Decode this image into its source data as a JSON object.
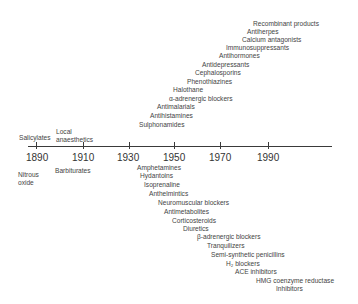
{
  "timeline": {
    "years": [
      "1890",
      "1910",
      "1930",
      "1950",
      "1970",
      "1990"
    ],
    "above": {
      "salicylates": "Salicylates",
      "local_anaesthetics_1": "Local",
      "local_anaesthetics_2": "anaesthetics",
      "items": [
        "Recombinant products",
        "Antiherpes",
        "Calcium antagonists",
        "Immunosuppressants",
        "Antihormones",
        "Antidepressants",
        "Cephalosporins",
        "Phenothiazines",
        "Halothane",
        "α-adrenergic blockers",
        "Antimalarials",
        "Antihistamines",
        "Sulphonamides"
      ]
    },
    "below": {
      "nitrous_oxide_1": "Nitrous",
      "nitrous_oxide_2": "oxide",
      "barbiturates": "Barbiturates",
      "items": [
        "Amphetamines",
        "Hydantoins",
        "Isoprenaline",
        "Anthelmintics",
        "Neuromuscular blockers",
        "Antimetabolites",
        "Corticosteroids",
        "Diuretics",
        "β-adrenergic blockers",
        "Tranquilizers",
        "Semi-synthetic penicillins",
        "H₂ blockers",
        "ACE inhibitors",
        "HMG coenzyme reductase",
        "Inhibitors"
      ]
    }
  }
}
